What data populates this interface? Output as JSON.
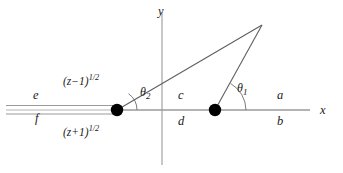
{
  "figure": {
    "type": "branch-cut-diagram",
    "background_color": "#ffffff",
    "line_color": "#8a8a8a",
    "ray_color": "#5a5a5a",
    "text_color": "#1a1a1a",
    "dot_color": "#000000"
  },
  "axes": {
    "x_label": "x",
    "y_label": "y",
    "x_axis": {
      "y": 110,
      "x_start": 6,
      "x_end": 310
    },
    "y_axis": {
      "x": 162,
      "y_start": 12,
      "y_end": 165
    }
  },
  "branch_points": [
    {
      "name": "left-branch-point",
      "x": 117,
      "y": 110
    },
    {
      "name": "right-branch-point",
      "x": 215,
      "y": 110
    }
  ],
  "apex": {
    "x": 262,
    "y": 25
  },
  "branch_cut": {
    "description": "double line along negative x-axis",
    "x_start": 6,
    "x_end": 117,
    "upper_y": 105,
    "lower_y": 114
  },
  "angles": [
    {
      "name": "theta-2",
      "base": "θ",
      "sub": "2",
      "x": 143,
      "y": 92,
      "arc_radius": 20,
      "vertex_x": 117
    },
    {
      "name": "theta-1",
      "base": "θ",
      "sub": "1",
      "x": 239,
      "y": 88,
      "arc_radius": 31,
      "vertex_x": 215
    }
  ],
  "region_labels": [
    {
      "name": "label-e",
      "text": "e",
      "x": 33,
      "y": 96
    },
    {
      "name": "label-f",
      "text": "f",
      "x": 33,
      "y": 117
    },
    {
      "name": "label-c",
      "text": "c",
      "x": 178,
      "y": 96
    },
    {
      "name": "label-d",
      "text": "d",
      "x": 178,
      "y": 118
    },
    {
      "name": "label-a",
      "text": "a",
      "x": 277,
      "y": 95
    },
    {
      "name": "label-b",
      "text": "b",
      "x": 277,
      "y": 118
    }
  ],
  "expressions": [
    {
      "name": "upper-branch-expression",
      "base": "(z−1)",
      "exponent": "1/2",
      "x": 63,
      "y": 79
    },
    {
      "name": "lower-branch-expression",
      "base": "(z+1)",
      "exponent": "1/2",
      "x": 63,
      "y": 129
    }
  ]
}
